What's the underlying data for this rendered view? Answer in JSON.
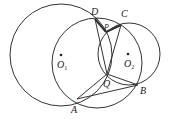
{
  "diagram": {
    "type": "geometry",
    "stroke_color": "#333333",
    "circles": [
      {
        "name": "circle-O1",
        "cx": 61,
        "cy": 55,
        "r": 51
      },
      {
        "name": "circle-middle",
        "cx": 97,
        "cy": 63,
        "r": 45
      },
      {
        "name": "circle-O2",
        "cx": 129,
        "cy": 54,
        "r": 31
      }
    ],
    "points": {
      "D": {
        "x": 95,
        "y": 19,
        "label": "D"
      },
      "C": {
        "x": 121,
        "y": 25,
        "label": "C"
      },
      "P": {
        "x": 106,
        "y": 32,
        "label": "P"
      },
      "Q": {
        "x": 107,
        "y": 74,
        "label": "Q"
      },
      "A": {
        "x": 77,
        "y": 99,
        "label": "A"
      },
      "B": {
        "x": 138,
        "y": 85,
        "label": "B"
      },
      "O1": {
        "x": 61,
        "y": 55,
        "label": "O",
        "sub": "1"
      },
      "O2": {
        "x": 128,
        "y": 54,
        "label": "O",
        "sub": "2"
      }
    },
    "segments": [
      {
        "from": "D",
        "to": "Q"
      },
      {
        "from": "C",
        "to": "Q"
      },
      {
        "from": "D",
        "to": "P",
        "thick": true
      },
      {
        "from": "P",
        "to": "C",
        "thick": true
      },
      {
        "from": "A",
        "to": "Q"
      },
      {
        "from": "A",
        "to": "B"
      },
      {
        "from": "Q",
        "to": "B"
      }
    ]
  }
}
